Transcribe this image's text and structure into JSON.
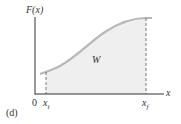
{
  "figure": {
    "panel_label": "(d)",
    "y_axis_label": "F(x)",
    "x_axis_label": "x",
    "origin_label": "0",
    "xi_label": "x",
    "xi_sub": "i",
    "xf_label": "x",
    "xf_sub": "f",
    "area_label": "W"
  },
  "colors": {
    "axis": "#333333",
    "curve": "#b8b8b8",
    "fill": "#efefef",
    "dashed": "#555555"
  }
}
